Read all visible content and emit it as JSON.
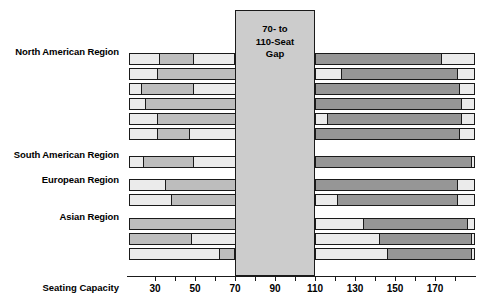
{
  "chart_data": {
    "type": "bar",
    "title": "",
    "subtitle": "",
    "xlabel": "Seating Capacity",
    "ylabel": "",
    "orientation": "horizontal",
    "stacked": true,
    "grid": false,
    "legend": null,
    "xlim": [
      17,
      190
    ],
    "xticks": [
      30,
      40,
      50,
      60,
      70,
      80,
      90,
      100,
      110,
      120,
      130,
      140,
      150,
      160,
      170,
      180
    ],
    "xtick_labels_shown": [
      "30",
      "50",
      "70",
      "90",
      "110",
      "130",
      "150",
      "170"
    ],
    "annotation": {
      "text": "70- to 110-Seat Gap",
      "lines": [
        "70- to",
        "110-Seat",
        "Gap"
      ],
      "x_range": [
        70,
        110
      ],
      "fill": "#cccccc"
    },
    "group_labels": [
      "North American Region",
      "South American Region",
      "European Region",
      "Asian Region"
    ],
    "palette": {
      "light": "#ebebeb",
      "mid": "#bdbdbd",
      "dark": "#969696",
      "white": "#f7f7f7",
      "outline": "#1a1a1a",
      "gap_fill": "#cccccc"
    },
    "series_note": "Each row is one operator; stacked segments give cumulative seating-capacity breakpoints. Values are breakpoint positions along the Seating Capacity axis.",
    "rows": [
      {
        "group": "North American Region",
        "start": 17,
        "breaks": [
          32,
          49,
          70
        ],
        "right_breaks": [
          110,
          173,
          190
        ],
        "fills": [
          "light",
          "mid",
          "light"
        ],
        "right_fills": [
          "dark",
          "light"
        ]
      },
      {
        "group": "North American Region",
        "start": 17,
        "breaks": [
          31,
          98,
          108
        ],
        "right_breaks": [
          110,
          123,
          181,
          190
        ],
        "fills": [
          "light",
          "mid",
          "light"
        ],
        "right_fills": [
          "light",
          "dark",
          "light"
        ]
      },
      {
        "group": "North American Region",
        "start": 17,
        "breaks": [
          23,
          49,
          110
        ],
        "right_breaks": [
          110,
          182,
          190
        ],
        "fills": [
          "light",
          "mid",
          "light"
        ],
        "right_fills": [
          "dark",
          "light"
        ]
      },
      {
        "group": "North American Region",
        "start": 17,
        "breaks": [
          25,
          96,
          110
        ],
        "right_breaks": [
          110,
          183,
          190
        ],
        "fills": [
          "light",
          "mid",
          "light"
        ],
        "right_fills": [
          "dark",
          "light"
        ]
      },
      {
        "group": "North American Region",
        "start": 17,
        "breaks": [
          31,
          95,
          110
        ],
        "right_breaks": [
          110,
          116,
          183,
          190
        ],
        "fills": [
          "light",
          "mid",
          "light"
        ],
        "right_fills": [
          "light",
          "dark",
          "light"
        ]
      },
      {
        "group": "North American Region",
        "start": 17,
        "breaks": [
          31,
          47,
          110
        ],
        "right_breaks": [
          110,
          182,
          190
        ],
        "fills": [
          "light",
          "mid",
          "light"
        ],
        "right_fills": [
          "dark",
          "light"
        ]
      },
      {
        "group": "South American Region",
        "start": 17,
        "breaks": [
          24,
          49,
          110
        ],
        "right_breaks": [
          110,
          188,
          190
        ],
        "fills": [
          "light",
          "mid",
          "light"
        ],
        "right_fills": [
          "dark",
          "light"
        ]
      },
      {
        "group": "European Region",
        "start": 17,
        "breaks": [
          35,
          110
        ],
        "right_breaks": [
          110,
          181,
          190
        ],
        "fills": [
          "light",
          "mid"
        ],
        "right_fills": [
          "dark",
          "light"
        ]
      },
      {
        "group": "European Region",
        "start": 17,
        "breaks": [
          38,
          103,
          110
        ],
        "right_breaks": [
          110,
          121,
          181,
          190
        ],
        "fills": [
          "light",
          "mid",
          "light"
        ],
        "right_fills": [
          "light",
          "dark",
          "light"
        ]
      },
      {
        "group": "Asian Region",
        "start": 17,
        "breaks": [
          110
        ],
        "right_breaks": [
          110,
          134,
          186,
          190
        ],
        "fills": [
          "mid"
        ],
        "right_fills": [
          "light",
          "dark",
          "light"
        ]
      },
      {
        "group": "Asian Region",
        "start": 17,
        "breaks": [
          48,
          110
        ],
        "right_breaks": [
          110,
          142,
          188,
          190
        ],
        "fills": [
          "mid",
          "light"
        ],
        "right_fills": [
          "light",
          "dark",
          "light"
        ]
      },
      {
        "group": "Asian Region",
        "start": 17,
        "breaks": [
          62,
          70
        ],
        "right_breaks": [
          110,
          146,
          188,
          190
        ],
        "fills": [
          "light",
          "mid"
        ],
        "right_fills": [
          "light",
          "dark",
          "light"
        ]
      }
    ]
  },
  "axis": {
    "title": "Seating Capacity",
    "tick_labels": [
      "30",
      "50",
      "70",
      "90",
      "110",
      "130",
      "150",
      "170"
    ]
  },
  "labels": {
    "north_american": "North American Region",
    "south_american": "South American Region",
    "european": "European Region",
    "asian": "Asian Region"
  },
  "gap": {
    "line1": "70- to",
    "line2": "110-Seat",
    "line3": "Gap"
  }
}
